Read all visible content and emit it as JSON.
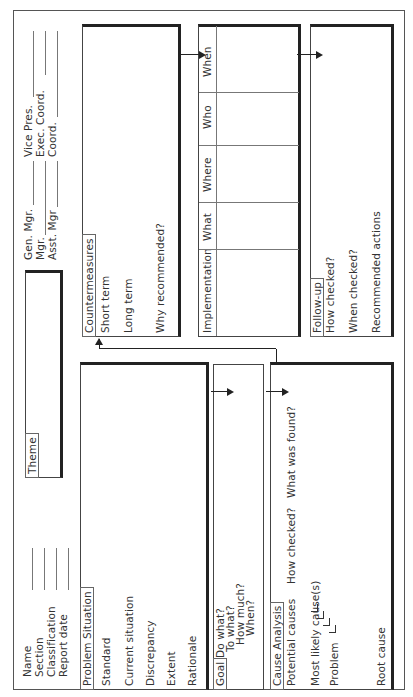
{
  "header": {
    "left_fields": [
      "Name",
      "Section",
      "Classification",
      "Report date"
    ],
    "theme_label": "Theme",
    "approvals_col1": [
      "Gen. Mgr.",
      "Mgr.",
      "Asst. Mgr"
    ],
    "approvals_col2": [
      "Vice Pres.",
      "Exec. Coord.",
      "Coord."
    ]
  },
  "problem_situation": {
    "title": "Problem Situation",
    "items": [
      "Standard",
      "Current situation",
      "Discrepancy",
      "Extent",
      "Rationale"
    ]
  },
  "goal": {
    "title": "Goal",
    "questions": [
      "Do what?",
      "To what?",
      "How much?",
      "When?"
    ]
  },
  "cause_analysis": {
    "title": "Cause Analysis",
    "potential_causes": "Potential causes",
    "how_checked": "How checked?",
    "what_found": "What was found?",
    "most_likely": "Most likely cause(s)",
    "problem": "Problem",
    "root_cause": "Root cause"
  },
  "countermeasures": {
    "title": "Countermeasures",
    "items": [
      "Short term",
      "Long term",
      "Why recommended?"
    ]
  },
  "implementation": {
    "title": "Implementation",
    "columns": [
      "What",
      "Where",
      "Who",
      "When"
    ]
  },
  "follow_up": {
    "title": "Follow-up",
    "items": [
      "How checked?",
      "When checked?",
      "Recommended actions"
    ]
  }
}
